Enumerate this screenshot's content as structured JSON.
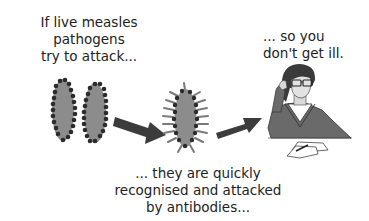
{
  "diagram": {
    "colors": {
      "pathogen_body": "#8c8c8c",
      "pathogen_dots": "#2b2b2b",
      "arrow": "#3c3c3c",
      "sweater": "#6a6a6a",
      "hair": "#3a3a3a",
      "text": "#222222"
    },
    "steps": [
      {
        "id": "step-1",
        "caption": "If live measles\npathogens\ntry to attack...",
        "icon": "measles-pathogens-icon"
      },
      {
        "id": "step-2",
        "caption": "... they are quickly\nrecognised and attacked\nby antibodies...",
        "icon": "antibody-bound-pathogen-icon"
      },
      {
        "id": "step-3",
        "caption": "... so you\ndon't get ill.",
        "icon": "healthy-person-icon"
      }
    ],
    "arrows": [
      {
        "from": "step-1",
        "to": "step-2",
        "icon": "arrow-right-down-icon"
      },
      {
        "from": "step-2",
        "to": "step-3",
        "icon": "arrow-right-up-icon"
      }
    ]
  }
}
